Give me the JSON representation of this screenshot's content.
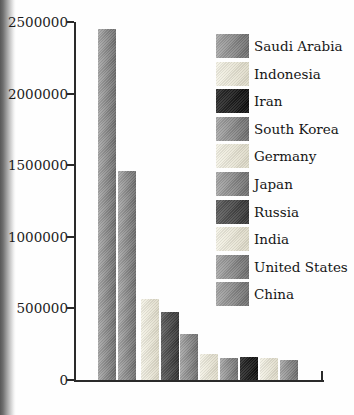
{
  "chart_data": {
    "type": "bar",
    "title": "",
    "xlabel": "",
    "ylabel": "",
    "categories": [
      "China",
      "United States",
      "India",
      "Russia",
      "Japan",
      "Germany",
      "South Korea",
      "Iran",
      "Indonesia",
      "Saudi Arabia"
    ],
    "values": [
      2450000,
      1460000,
      565000,
      475000,
      325000,
      185000,
      152000,
      158000,
      152000,
      138000
    ],
    "bar_color_keys": [
      "gray",
      "gray",
      "cream",
      "darkgray",
      "gray",
      "cream",
      "gray",
      "black",
      "cream",
      "gray"
    ],
    "ylim": [
      0,
      2500000
    ],
    "y_ticks": [
      "2500000",
      "2000000",
      "1500000",
      "1000000",
      "500000",
      "0"
    ],
    "grid": false,
    "legend": {
      "position": "upper right",
      "entries": [
        {
          "label": "Saudi Arabia",
          "color_key": "gray"
        },
        {
          "label": "Indonesia",
          "color_key": "cream"
        },
        {
          "label": "Iran",
          "color_key": "black"
        },
        {
          "label": "South Korea",
          "color_key": "gray"
        },
        {
          "label": "Germany",
          "color_key": "cream"
        },
        {
          "label": "Japan",
          "color_key": "gray"
        },
        {
          "label": "Russia",
          "color_key": "darkgray"
        },
        {
          "label": "India",
          "color_key": "cream"
        },
        {
          "label": "United States",
          "color_key": "gray"
        },
        {
          "label": "China",
          "color_key": "gray"
        }
      ]
    }
  },
  "palette": {
    "gray": {
      "from": "#a9a9a9",
      "to": "#6d6d6d"
    },
    "cream": {
      "from": "#f4f2e6",
      "to": "#ddd9c7"
    },
    "darkgray": {
      "from": "#606060",
      "to": "#343434"
    },
    "black": {
      "from": "#2f2f2f",
      "to": "#0d0d0d"
    },
    "axis_color": "#2a2a2a",
    "text_color": "#1c1c1c"
  }
}
